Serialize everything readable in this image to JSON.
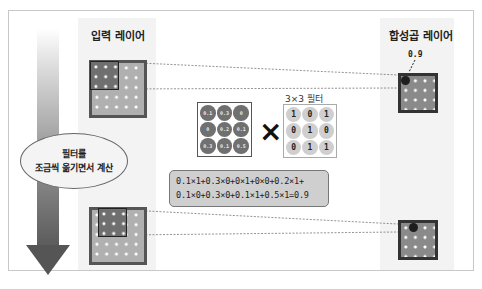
{
  "input_layer": {
    "label": "입력 레이어"
  },
  "conv_layer": {
    "label": "합성곱 레이어",
    "result_value": "0.9"
  },
  "side_note": {
    "line1": "필터를",
    "line2": "조금씩 옮기면서 계산"
  },
  "input_patch": {
    "values": [
      [
        "0.1",
        "0.3",
        "0"
      ],
      [
        "0",
        "0.2",
        "0.1"
      ],
      [
        "0.3",
        "0.1",
        "0.5"
      ]
    ]
  },
  "operator": "×",
  "filter": {
    "title": "3×3 필터",
    "values": [
      [
        "1",
        "0",
        "1"
      ],
      [
        "0",
        "1",
        "0"
      ],
      [
        "0",
        "1",
        "1"
      ]
    ]
  },
  "formula": {
    "line1": "0.1×1+0.3×0+0×1+0×0+0.2×1+",
    "line2": "0.1×0+0.3×0+0.1×1+0.5×1=0.9"
  },
  "colors": {
    "input_grid": "#b0b0b0",
    "input_window": "#6f6f6f",
    "output_grid": "#8a8a8a",
    "formula_bg": "#cfcfcf",
    "arrow": "#555555"
  }
}
